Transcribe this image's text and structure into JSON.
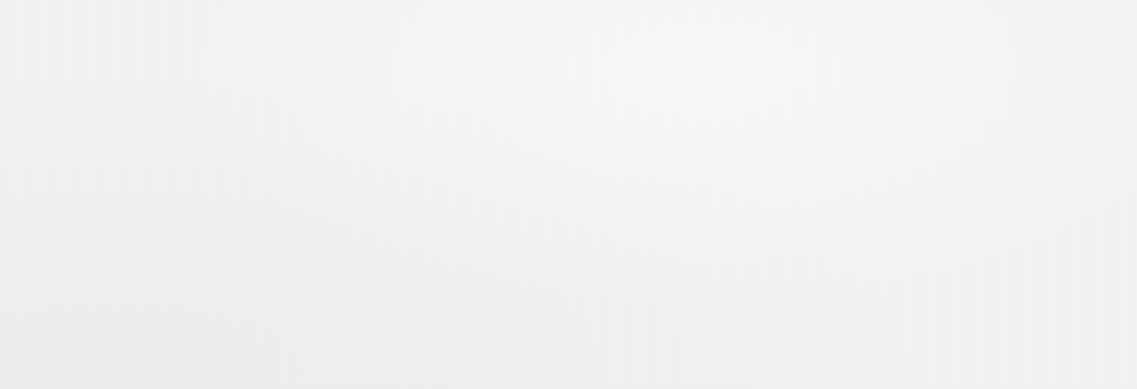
{
  "chart_data": {
    "type": "bar",
    "title": "",
    "subtitle": "",
    "xlabel": "",
    "ylabel": "",
    "categories": [
      "2014",
      "2015",
      "2016",
      "2017",
      "2018",
      "2019",
      "2020",
      "2021",
      "2022",
      "2023"
    ],
    "values": [
      5.5,
      6.25,
      6.3,
      5.95,
      5.4,
      5.9,
      6.55,
      5.45,
      4.6,
      8.0
    ],
    "series": [
      {
        "name": "",
        "values": [
          5.5,
          6.25,
          6.3,
          5.95,
          5.4,
          5.9,
          6.55,
          5.45,
          4.6,
          8.0
        ]
      }
    ],
    "ylim": [
      0,
      9
    ],
    "ytick_labels": [
      "0",
      "1",
      "2",
      "3",
      "4",
      "5",
      "6",
      "7",
      "8",
      "9"
    ],
    "ytick_values": [
      0,
      1,
      2,
      3,
      4,
      5,
      6,
      7,
      8,
      9
    ],
    "xtick_labels": [
      "2014",
      "2015",
      "2016",
      "2017",
      "2018",
      "2019",
      "2020",
      "2021",
      "2022",
      "2023"
    ],
    "grid": true,
    "grid_axis": "y",
    "legend": false,
    "legend_position": "none",
    "annotations": [],
    "bar_color": "#3f6eb3",
    "grid_color": "#b9b9b5",
    "axis_color": "#b3b3af",
    "text_color": "#262626",
    "background_color": "#f5f4f2"
  }
}
